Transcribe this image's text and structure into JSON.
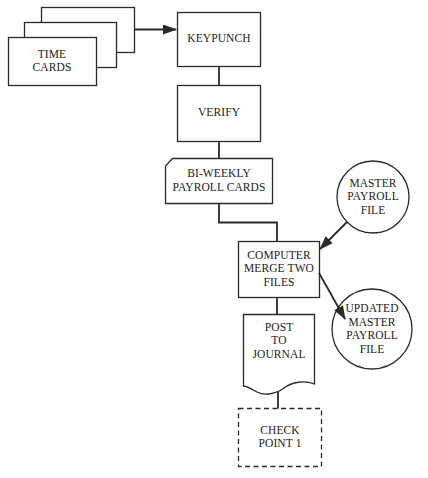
{
  "diagram": {
    "type": "flowchart",
    "colors": {
      "stroke": "#2a2a2a",
      "text": "#222222",
      "background": "#ffffff"
    },
    "nodes": {
      "time_cards": {
        "shape": "card-stack",
        "lines": [
          "TIME",
          "CARDS"
        ]
      },
      "keypunch": {
        "shape": "rectangle",
        "lines": [
          "KEYPUNCH"
        ]
      },
      "verify": {
        "shape": "rectangle",
        "lines": [
          "VERIFY"
        ]
      },
      "payroll_cards": {
        "shape": "punched-card",
        "lines": [
          "BI-WEEKLY",
          "PAYROLL CARDS"
        ]
      },
      "computer_merge": {
        "shape": "rectangle",
        "lines": [
          "COMPUTER",
          "MERGE TWO",
          "FILES"
        ]
      },
      "master_file": {
        "shape": "circle",
        "lines": [
          "MASTER",
          "PAYROLL",
          "FILE"
        ]
      },
      "updated_master": {
        "shape": "circle",
        "lines": [
          "UPDATED",
          "MASTER",
          "PAYROLL",
          "FILE"
        ]
      },
      "post_journal": {
        "shape": "document",
        "lines": [
          "POST",
          "TO",
          "JOURNAL"
        ]
      },
      "checkpoint": {
        "shape": "dashed-rectangle",
        "lines": [
          "CHECK",
          "POINT 1"
        ]
      }
    },
    "edges": [
      {
        "from": "time_cards",
        "to": "keypunch",
        "arrow": true
      },
      {
        "from": "keypunch",
        "to": "verify",
        "arrow": false
      },
      {
        "from": "verify",
        "to": "payroll_cards",
        "arrow": false
      },
      {
        "from": "payroll_cards",
        "to": "computer_merge",
        "arrow": false
      },
      {
        "from": "master_file",
        "to": "computer_merge",
        "arrow": true
      },
      {
        "from": "computer_merge",
        "to": "updated_master",
        "arrow": true
      },
      {
        "from": "computer_merge",
        "to": "post_journal",
        "arrow": false
      },
      {
        "from": "post_journal",
        "to": "checkpoint",
        "arrow": false
      }
    ]
  }
}
